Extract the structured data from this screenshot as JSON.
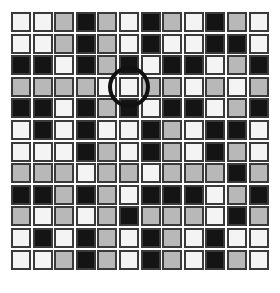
{
  "board": {
    "rows": 12,
    "cols": 12,
    "colors": {
      "W": "#f4f4f4",
      "G": "#b8b8b8",
      "B": "#141414"
    },
    "grid": [
      [
        "W",
        "W",
        "G",
        "B",
        "G",
        "W",
        "B",
        "G",
        "W",
        "B",
        "G",
        "W"
      ],
      [
        "W",
        "W",
        "G",
        "B",
        "G",
        "W",
        "B",
        "W",
        "W",
        "B",
        "B",
        "W"
      ],
      [
        "B",
        "B",
        "W",
        "B",
        "G",
        "B",
        "W",
        "B",
        "B",
        "W",
        "G",
        "B"
      ],
      [
        "G",
        "G",
        "G",
        "G",
        "W",
        "W",
        "G",
        "G",
        "W",
        "G",
        "W",
        "G"
      ],
      [
        "B",
        "B",
        "W",
        "B",
        "G",
        "B",
        "W",
        "B",
        "B",
        "W",
        "G",
        "B"
      ],
      [
        "W",
        "B",
        "W",
        "B",
        "W",
        "W",
        "B",
        "G",
        "W",
        "B",
        "B",
        "W"
      ],
      [
        "W",
        "W",
        "W",
        "B",
        "G",
        "W",
        "B",
        "G",
        "W",
        "B",
        "G",
        "W"
      ],
      [
        "G",
        "G",
        "G",
        "W",
        "G",
        "G",
        "W",
        "G",
        "G",
        "G",
        "B",
        "G"
      ],
      [
        "B",
        "B",
        "G",
        "B",
        "G",
        "W",
        "B",
        "B",
        "B",
        "W",
        "G",
        "B"
      ],
      [
        "G",
        "W",
        "G",
        "W",
        "G",
        "B",
        "G",
        "G",
        "G",
        "W",
        "B",
        "G"
      ],
      [
        "W",
        "B",
        "W",
        "B",
        "G",
        "W",
        "B",
        "G",
        "W",
        "B",
        "W",
        "W"
      ],
      [
        "W",
        "W",
        "G",
        "B",
        "G",
        "W",
        "B",
        "G",
        "W",
        "B",
        "G",
        "W"
      ]
    ],
    "selected": {
      "row": 3,
      "col": 5
    }
  }
}
